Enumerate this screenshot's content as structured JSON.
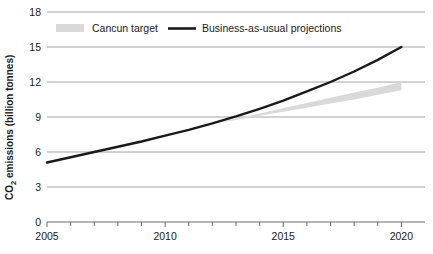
{
  "chart_data": {
    "type": "line",
    "title": "",
    "xlabel": "",
    "ylabel": "CO₂ emissions (billion tonnes)",
    "ylabel_main": "CO",
    "ylabel_sub": "2",
    "ylabel_rest": " emissions (billion tonnes)",
    "xlim": [
      2005,
      2021
    ],
    "ylim": [
      0,
      18
    ],
    "grid": true,
    "legend_position": "top",
    "x_tick_labels": [
      "2005",
      "2010",
      "2015",
      "2020"
    ],
    "x_tick_values": [
      2005,
      2010,
      2015,
      2020
    ],
    "x_minor_ticks": [
      2005,
      2006,
      2007,
      2008,
      2009,
      2010,
      2011,
      2012,
      2013,
      2014,
      2015,
      2016,
      2017,
      2018,
      2019,
      2020
    ],
    "y_tick_labels": [
      "0",
      "3",
      "6",
      "9",
      "12",
      "15",
      "18"
    ],
    "y_tick_values": [
      0,
      3,
      6,
      9,
      12,
      15,
      18
    ],
    "x": [
      2005,
      2006,
      2007,
      2008,
      2009,
      2010,
      2011,
      2012,
      2013,
      2014,
      2015,
      2016,
      2017,
      2018,
      2019,
      2020
    ],
    "series": [
      {
        "name": "Business-as-usual projections",
        "style": "line",
        "color": "#1a1a1a",
        "values": [
          5.1,
          5.55,
          6.0,
          6.45,
          6.9,
          7.4,
          7.9,
          8.45,
          9.05,
          9.7,
          10.4,
          11.2,
          12.0,
          12.9,
          13.9,
          15.0
        ]
      },
      {
        "name": "Cancun target",
        "style": "band",
        "color": "#d9d9d9",
        "band_start_year": 2012,
        "upper": [
          8.45,
          8.85,
          9.3,
          9.75,
          10.2,
          10.65,
          11.1,
          11.5,
          12.0
        ],
        "lower": [
          8.45,
          8.75,
          9.1,
          9.45,
          9.8,
          10.15,
          10.5,
          10.9,
          11.3
        ],
        "band_x": [
          2012,
          2013,
          2014,
          2015,
          2016,
          2017,
          2018,
          2019,
          2020
        ]
      }
    ]
  },
  "legend": {
    "items": [
      {
        "label": "Cancun target",
        "marker": "swatch",
        "color": "#d9d9d9"
      },
      {
        "label": "Business-as-usual projections",
        "marker": "line",
        "color": "#1a1a1a"
      }
    ]
  },
  "colors": {
    "background": "#ffffff",
    "gridline": "#9a9a9a",
    "axis": "#5a5a5a",
    "text": "#1a1a1a",
    "band": "#d9d9d9",
    "line": "#1a1a1a"
  }
}
